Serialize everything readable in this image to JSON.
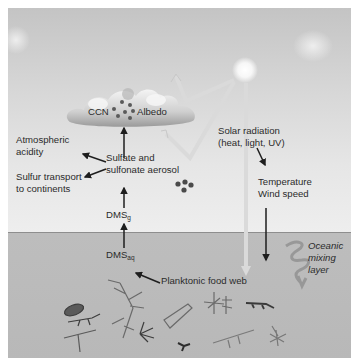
{
  "diagram": {
    "labels": {
      "ccn": "CCN",
      "albedo": "Albedo",
      "atmospheric_acidity_line1": "Atmospheric",
      "atmospheric_acidity_line2": "acidity",
      "sulfur_transport_line1": "Sulfur transport",
      "sulfur_transport_line2": "to continents",
      "sulfate_line1": "Sulfate and",
      "sulfate_line2": "sulfonate aerosol",
      "dms_g_base": "DMS",
      "dms_g_sub": "g",
      "dms_aq_base": "DMS",
      "dms_aq_sub": "aq",
      "planktonic_food_web": "Planktonic food web",
      "solar_line1": "Solar radiation",
      "solar_line2": "(heat, light, UV)",
      "temperature": "Temperature",
      "wind_speed": "Wind speed",
      "oceanic_line1": "Oceanic",
      "oceanic_line2": "mixing",
      "oceanic_line3": "layer"
    },
    "colors": {
      "sky_top": "#c4c4c4",
      "sky_bottom": "#eeeeee",
      "sea": "#bbbbbb",
      "arrow": "#1e1e1e",
      "light_beam": "#d9d9d9",
      "aerosol_dot": "#4a4a4a",
      "sun": "#ffffff"
    }
  }
}
